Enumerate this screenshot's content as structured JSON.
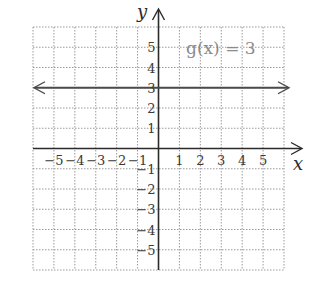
{
  "chart_data": {
    "type": "line",
    "title": "",
    "function_label": "g(x) = 3",
    "series": [
      {
        "name": "g(x) = 3",
        "x": [
          -6,
          6
        ],
        "y": [
          3,
          3
        ],
        "extends_both_directions": true
      }
    ],
    "xlabel": "x",
    "ylabel": "y",
    "xlim": [
      -6,
      6
    ],
    "ylim": [
      -6,
      6
    ],
    "x_ticks": [
      -5,
      -4,
      -3,
      -2,
      -1,
      1,
      2,
      3,
      4,
      5
    ],
    "y_ticks": [
      5,
      4,
      3,
      2,
      1,
      -1,
      -2,
      -3,
      -4,
      -5
    ],
    "x_tick_labels": [
      "−5",
      "−4",
      "−3",
      "−2",
      "−1",
      "1",
      "2",
      "3",
      "4",
      "5"
    ],
    "y_tick_labels": [
      "5",
      "4",
      "3",
      "2",
      "1",
      "−1",
      "−2",
      "−3",
      "−4",
      "−5"
    ],
    "grid": true,
    "grid_style": "dotted",
    "colors": {
      "axis": "#2b2b2b",
      "grid": "#9a9a9a",
      "line": "#4a4a4a",
      "label": "#8a8a8a"
    }
  }
}
